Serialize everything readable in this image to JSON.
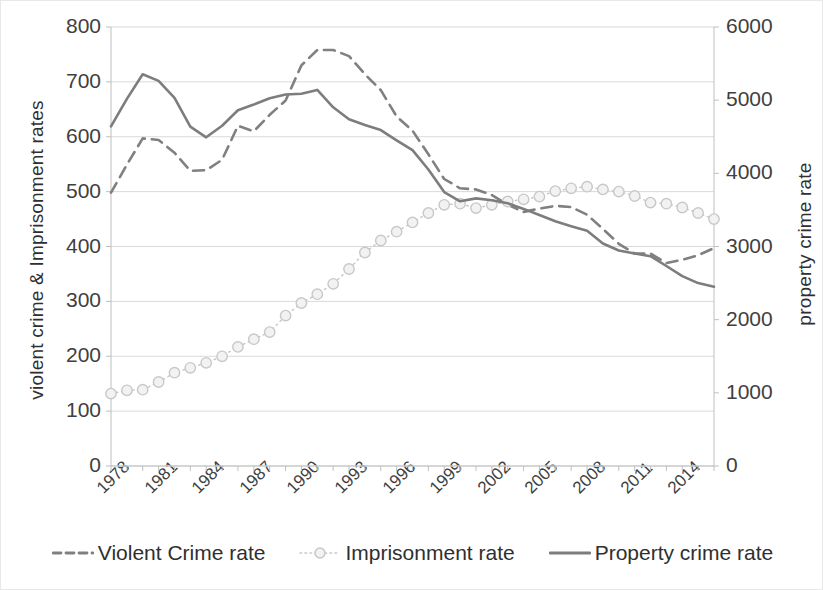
{
  "chart_data": {
    "type": "line",
    "title": "",
    "xlabel": "",
    "ylabel": "violent crime & Imprisonment rates",
    "ylabel_secondary": "property crime rate",
    "grid": true,
    "legend_position": "bottom",
    "x": [
      1978,
      1979,
      1980,
      1981,
      1982,
      1983,
      1984,
      1985,
      1986,
      1987,
      1988,
      1989,
      1990,
      1991,
      1992,
      1993,
      1994,
      1995,
      1996,
      1997,
      1998,
      1999,
      2000,
      2001,
      2002,
      2003,
      2004,
      2005,
      2006,
      2007,
      2008,
      2009,
      2010,
      2011,
      2012,
      2013,
      2014,
      2015,
      2016
    ],
    "xtick_labels": [
      "1978",
      "1981",
      "1984",
      "1987",
      "1990",
      "1993",
      "1996",
      "1999",
      "2002",
      "2005",
      "2008",
      "2011",
      "2014"
    ],
    "xtick_values": [
      1978,
      1981,
      1984,
      1987,
      1990,
      1993,
      1996,
      1999,
      2002,
      2005,
      2008,
      2011,
      2014
    ],
    "ylim": [
      0,
      800
    ],
    "ytick_labels": [
      "0",
      "100",
      "200",
      "300",
      "400",
      "500",
      "600",
      "700",
      "800"
    ],
    "ytick_values": [
      0,
      100,
      200,
      300,
      400,
      500,
      600,
      700,
      800
    ],
    "ylim_secondary": [
      0,
      6000
    ],
    "ytick_labels_secondary": [
      "0",
      "1000",
      "2000",
      "3000",
      "4000",
      "5000",
      "6000"
    ],
    "ytick_values_secondary": [
      0,
      1000,
      2000,
      3000,
      4000,
      5000,
      6000
    ],
    "series": [
      {
        "name": "Violent Crime rate",
        "axis": "left",
        "style": "dashed",
        "color": "#808080",
        "values": [
          498,
          549,
          597,
          594,
          571,
          538,
          539,
          558,
          620,
          610,
          640,
          666,
          730,
          758,
          758,
          747,
          714,
          685,
          637,
          611,
          568,
          523,
          506,
          504,
          494,
          476,
          463,
          469,
          474,
          472,
          458,
          432,
          405,
          387,
          387,
          370,
          376,
          384,
          397
        ]
      },
      {
        "name": "Imprisonment rate",
        "axis": "left",
        "style": "dotted-marker",
        "color": "#c8c8c8",
        "values": [
          132,
          138,
          139,
          153,
          170,
          179,
          188,
          200,
          217,
          231,
          244,
          274,
          297,
          313,
          332,
          359,
          389,
          411,
          427,
          444,
          461,
          476,
          478,
          470,
          476,
          482,
          486,
          491,
          501,
          506,
          509,
          504,
          500,
          492,
          480,
          478,
          471,
          461,
          450
        ]
      },
      {
        "name": "Property crime rate",
        "axis": "right",
        "style": "solid",
        "color": "#7d7d7d",
        "values": [
          4643,
          5017,
          5353,
          5264,
          5033,
          4637,
          4492,
          4651,
          4863,
          4940,
          5027,
          5078,
          5088,
          5140,
          4903,
          4740,
          4660,
          4591,
          4451,
          4316,
          4052,
          3743,
          3618,
          3658,
          3631,
          3591,
          3514,
          3431,
          3346,
          3276,
          3214,
          3041,
          2946,
          2905,
          2868,
          2733,
          2596,
          2500,
          2451
        ]
      }
    ]
  },
  "legend": {
    "items": [
      {
        "label": "Violent Crime rate",
        "style": "dashed",
        "color": "#808080"
      },
      {
        "label": "Imprisonment rate",
        "style": "dotted-marker",
        "color": "#c8c8c8"
      },
      {
        "label": "Property crime rate",
        "style": "solid",
        "color": "#7d7d7d"
      }
    ]
  },
  "colors": {
    "gridline": "#d9d9d9",
    "axis": "#bfbfbf",
    "text": "#3a3a3a",
    "background": "#ffffff"
  }
}
